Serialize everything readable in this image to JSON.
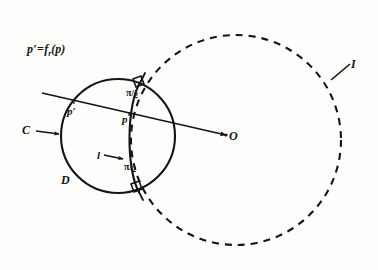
{
  "figure": {
    "background_color": "#fdfdfc",
    "ink_color": "#141414",
    "width": 378,
    "height": 270
  },
  "labels": {
    "formula_lhs": "p′=",
    "formula_fn": "f",
    "formula_subscript": "r",
    "formula_arg": "(p)",
    "point_p_prime": "p′",
    "point_p": "p",
    "circle_c": "C",
    "arc_d": "D",
    "center_o": "O",
    "circle_i": "I",
    "line_l": "l",
    "angle_numerator": "π",
    "angle_slash": "/",
    "angle_denominator": "2"
  },
  "geometry": {
    "circle_c": {
      "cx": 118,
      "cy": 136,
      "r": 57,
      "style": "solid"
    },
    "circle_i": {
      "cx": 236,
      "cy": 140,
      "r": 105,
      "style": "dashed"
    },
    "arc_l": {
      "from_x": 140,
      "from_y": 82,
      "to_x": 138,
      "to_y": 191
    },
    "transversal": {
      "x1": 42,
      "y1": 93,
      "x2": 228,
      "y2": 136
    },
    "right_angle_markers": 2
  }
}
